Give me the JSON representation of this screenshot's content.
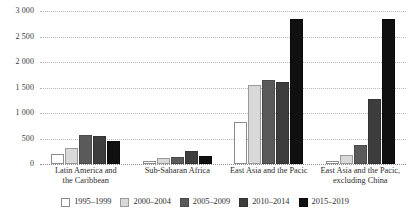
{
  "chart_data": {
    "type": "bar",
    "title": "",
    "subtitle": "",
    "xlabel": "",
    "ylabel": "",
    "ylim": [
      0,
      3000
    ],
    "yticks": [
      0,
      500,
      1000,
      1500,
      2000,
      2500,
      3000
    ],
    "ytick_labels": [
      "0",
      "500",
      "1 000",
      "1 500",
      "2 000",
      "2 500",
      "3 000"
    ],
    "grid": true,
    "legend_position": "bottom",
    "categories": [
      "Latin America and the Caribbean",
      "Sub-Saharan Africa",
      "East Asia and the Pacic",
      "East Asia and the Pacic, excluding China"
    ],
    "category_lines": [
      [
        "Latin America and",
        "the Caribbean"
      ],
      [
        "Sub-Saharan Africa"
      ],
      [
        "East Asia and the Pacic"
      ],
      [
        "East Asia and the Pacic,",
        "excluding China"
      ]
    ],
    "series": [
      {
        "name": "1995–1999",
        "color": "#ffffff",
        "values": [
          190,
          60,
          820,
          50
        ]
      },
      {
        "name": "2000–2004",
        "color": "#d9d9d9",
        "values": [
          310,
          120,
          1550,
          180
        ]
      },
      {
        "name": "2005–2009",
        "color": "#5a5a5a",
        "values": [
          560,
          130,
          1650,
          380
        ]
      },
      {
        "name": "2010–2014",
        "color": "#3d3d3d",
        "values": [
          555,
          250,
          1600,
          1270
        ]
      },
      {
        "name": "2015–2019",
        "color": "#101010",
        "values": [
          460,
          160,
          2850,
          2850
        ]
      }
    ]
  }
}
